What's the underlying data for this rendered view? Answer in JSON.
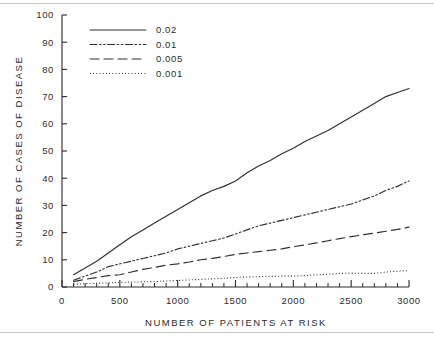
{
  "chart_data": {
    "type": "line",
    "title": "",
    "xlabel": "NUMBER OF PATIENTS AT RISK",
    "ylabel": "NUMBER OF CASES OF DISEASE",
    "xlim": [
      0,
      3000
    ],
    "ylim": [
      0,
      100
    ],
    "xticks": [
      0,
      500,
      1000,
      1500,
      2000,
      2500,
      3000
    ],
    "xtick_labels": [
      "0",
      "500",
      "1000",
      "1500",
      "2000",
      "2500",
      "3000"
    ],
    "x_minor_tick_step": 100,
    "yticks": [
      0,
      10,
      20,
      30,
      40,
      50,
      60,
      70,
      80,
      90,
      100
    ],
    "ytick_labels": [
      "0",
      "10",
      "20",
      "30",
      "40",
      "50",
      "60",
      "70",
      "80",
      "90",
      "100"
    ],
    "grid": false,
    "legend_position": "upper left",
    "legend_title": "",
    "x": [
      100,
      200,
      300,
      400,
      500,
      600,
      700,
      800,
      900,
      1000,
      1100,
      1200,
      1300,
      1400,
      1500,
      1600,
      1700,
      1800,
      1900,
      2000,
      2100,
      2200,
      2300,
      2400,
      2500,
      2600,
      2700,
      2800,
      2900,
      3000
    ],
    "series": [
      {
        "name": "0.02",
        "label": "0.02",
        "line_style": "solid",
        "color": "#303030",
        "values": [
          4.5,
          7.0,
          9.5,
          12.5,
          15.5,
          18.5,
          21.0,
          23.5,
          26.0,
          28.5,
          31.0,
          33.5,
          35.5,
          37.0,
          39.0,
          42.0,
          44.5,
          46.5,
          49.0,
          51.0,
          53.5,
          55.5,
          57.5,
          60.0,
          62.5,
          65.0,
          67.5,
          70.0,
          71.5,
          73.0
        ]
      },
      {
        "name": "0.01",
        "label": "0.01",
        "line_style": "dash-dot-dot",
        "color": "#303030",
        "values": [
          2.5,
          4.0,
          5.5,
          7.5,
          8.5,
          9.5,
          10.5,
          11.5,
          12.5,
          14.0,
          15.0,
          16.0,
          17.0,
          18.0,
          19.5,
          21.0,
          22.5,
          23.5,
          24.5,
          25.5,
          26.5,
          27.5,
          28.5,
          29.5,
          30.5,
          32.0,
          33.5,
          35.5,
          37.0,
          39.0
        ]
      },
      {
        "name": "0.005",
        "label": "0.005",
        "line_style": "long-dash",
        "color": "#303030",
        "values": [
          2.0,
          2.8,
          3.5,
          4.2,
          4.5,
          5.5,
          6.5,
          7.2,
          8.0,
          8.5,
          9.2,
          10.0,
          10.5,
          11.2,
          12.0,
          12.5,
          13.0,
          13.5,
          14.0,
          14.8,
          15.5,
          16.2,
          17.0,
          17.8,
          18.5,
          19.2,
          19.8,
          20.5,
          21.2,
          22.0
        ]
      },
      {
        "name": "0.001",
        "label": "0.001",
        "line_style": "dotted",
        "color": "#303030",
        "values": [
          1.0,
          1.2,
          1.4,
          1.5,
          1.7,
          1.8,
          1.9,
          2.0,
          2.2,
          2.4,
          2.6,
          2.8,
          3.0,
          3.2,
          3.5,
          3.7,
          3.8,
          3.9,
          4.0,
          4.0,
          4.2,
          4.5,
          4.7,
          5.0,
          5.1,
          5.0,
          5.0,
          5.5,
          5.8,
          6.0
        ]
      }
    ]
  },
  "colors": {
    "ink": "#2b2b2b",
    "line": "#303030",
    "rule": "#c9c9c9",
    "background": "#ffffff"
  }
}
